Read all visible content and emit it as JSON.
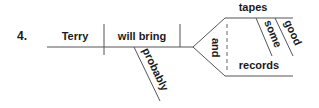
{
  "diagram": {
    "type": "Reed-Kellogg sentence diagram",
    "item_number": "4.",
    "subject": "Terry",
    "verb": "will bring",
    "adverb_modifier": "probably",
    "conjunction": "and",
    "compound_objects": [
      {
        "word": "tapes",
        "modifiers": [
          "some",
          "good"
        ]
      },
      {
        "word": "records",
        "modifiers": []
      }
    ],
    "colors": {
      "line": "#555555",
      "text": "#1a1a1a",
      "background": "#ffffff"
    }
  }
}
